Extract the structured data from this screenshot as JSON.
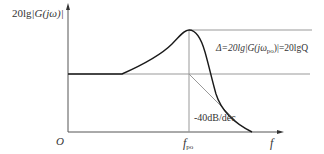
{
  "diagram": {
    "type": "bode-magnitude-plot",
    "y_axis_label": {
      "prefix": "20lg",
      "expr": "|G(jω)|"
    },
    "x_axis_label": "f",
    "origin_label": "O",
    "peak_frequency_label": {
      "main": "f",
      "sub": "po"
    },
    "slope_label": "-40dB/dec",
    "delta_annotation": {
      "text_start": "Δ=20lg|G(jω",
      "sub": "po",
      "text_end": ")|=20lgQ"
    },
    "colors": {
      "axis": "#555555",
      "curve": "#1a1a1a",
      "reference": "#999999",
      "text": "#333333"
    }
  }
}
